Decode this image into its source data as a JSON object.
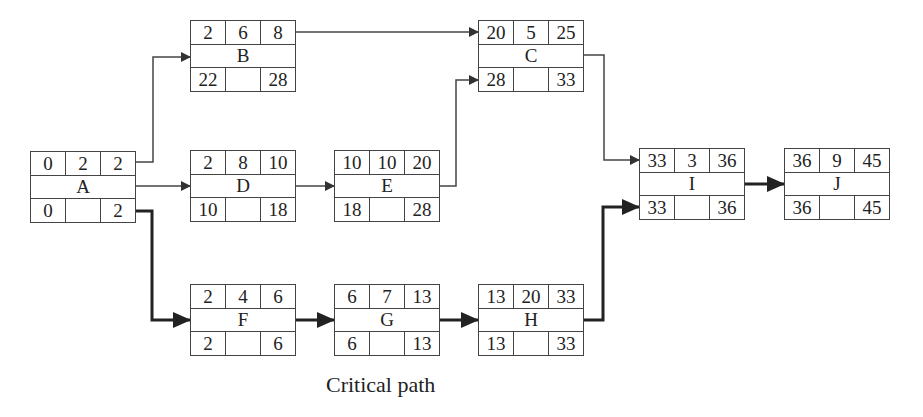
{
  "diagram": {
    "type": "activity-on-node network",
    "caption": "Critical path",
    "node_fields": {
      "top": [
        "ES",
        "Duration",
        "EF"
      ],
      "bottom": [
        "LS",
        "",
        "LF"
      ]
    },
    "nodes": {
      "A": {
        "label": "A",
        "es": "0",
        "dur": "2",
        "ef": "2",
        "ls": "0",
        "lf": "2",
        "x": 30,
        "y": 151
      },
      "B": {
        "label": "B",
        "es": "2",
        "dur": "6",
        "ef": "8",
        "ls": "22",
        "lf": "28",
        "x": 190,
        "y": 20
      },
      "C": {
        "label": "C",
        "es": "20",
        "dur": "5",
        "ef": "25",
        "ls": "28",
        "lf": "33",
        "x": 478,
        "y": 20
      },
      "D": {
        "label": "D",
        "es": "2",
        "dur": "8",
        "ef": "10",
        "ls": "10",
        "lf": "18",
        "x": 190,
        "y": 150
      },
      "E": {
        "label": "E",
        "es": "10",
        "dur": "10",
        "ef": "20",
        "ls": "18",
        "lf": "28",
        "x": 334,
        "y": 150
      },
      "F": {
        "label": "F",
        "es": "2",
        "dur": "4",
        "ef": "6",
        "ls": "2",
        "lf": "6",
        "x": 190,
        "y": 284
      },
      "G": {
        "label": "G",
        "es": "6",
        "dur": "7",
        "ef": "13",
        "ls": "6",
        "lf": "13",
        "x": 334,
        "y": 284
      },
      "H": {
        "label": "H",
        "es": "13",
        "dur": "20",
        "ef": "33",
        "ls": "13",
        "lf": "33",
        "x": 478,
        "y": 284
      },
      "I": {
        "label": "I",
        "es": "33",
        "dur": "3",
        "ef": "36",
        "ls": "33",
        "lf": "36",
        "x": 639,
        "y": 148
      },
      "J": {
        "label": "J",
        "es": "36",
        "dur": "9",
        "ef": "45",
        "ls": "36",
        "lf": "45",
        "x": 784,
        "y": 148
      }
    },
    "edges": [
      {
        "from": "A",
        "to": "B",
        "critical": false
      },
      {
        "from": "A",
        "to": "D",
        "critical": false
      },
      {
        "from": "A",
        "to": "F",
        "critical": true
      },
      {
        "from": "B",
        "to": "C",
        "critical": false
      },
      {
        "from": "D",
        "to": "E",
        "critical": false
      },
      {
        "from": "E",
        "to": "C",
        "critical": false
      },
      {
        "from": "C",
        "to": "I",
        "critical": false
      },
      {
        "from": "F",
        "to": "G",
        "critical": true
      },
      {
        "from": "G",
        "to": "H",
        "critical": true
      },
      {
        "from": "H",
        "to": "I",
        "critical": true
      },
      {
        "from": "I",
        "to": "J",
        "critical": true
      }
    ],
    "critical_path": [
      "A",
      "F",
      "G",
      "H",
      "I",
      "J"
    ],
    "colors": {
      "line": "#444444",
      "critical_line": "#222222",
      "background": "#ffffff"
    }
  }
}
